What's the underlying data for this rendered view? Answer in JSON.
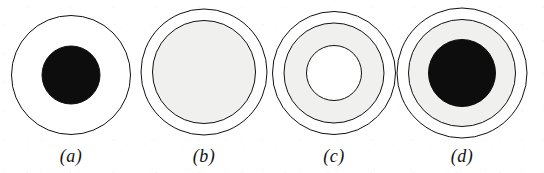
{
  "figure": {
    "kind": "concentric-circle-cross-sections",
    "background_color": "#ffffff",
    "stroke_color": "#111111",
    "fill_white": "#ffffff",
    "fill_gray": "#f0f0ee",
    "fill_black": "#0d0d0d",
    "panel_count": 4,
    "panels": [
      {
        "id": "a",
        "label": "(a)",
        "center_x": 71,
        "center_y": 75,
        "label_x": 71,
        "label_y": 147,
        "layers": [
          {
            "name": "outer-boundary",
            "diameter": 120,
            "fill": "#ffffff",
            "stroke": "#111111",
            "stroke_width": 1.6
          },
          {
            "name": "black-core",
            "diameter": 59,
            "fill": "#0d0d0d",
            "stroke": "#0d0d0d",
            "stroke_width": 1
          }
        ]
      },
      {
        "id": "b",
        "label": "(b)",
        "center_x": 204,
        "center_y": 72,
        "label_x": 204,
        "label_y": 147,
        "layers": [
          {
            "name": "outer-boundary",
            "diameter": 127,
            "fill": "#ffffff",
            "stroke": "#111111",
            "stroke_width": 1.6
          },
          {
            "name": "gray-inner-disc",
            "diameter": 104,
            "fill": "#f0f0ee",
            "stroke": "#111111",
            "stroke_width": 1.6
          }
        ]
      },
      {
        "id": "c",
        "label": "(c)",
        "center_x": 334,
        "center_y": 73,
        "label_x": 334,
        "label_y": 147,
        "layers": [
          {
            "name": "outer-boundary",
            "diameter": 124,
            "fill": "#ffffff",
            "stroke": "#111111",
            "stroke_width": 1.6
          },
          {
            "name": "gray-annulus",
            "diameter": 101,
            "fill": "#f0f0ee",
            "stroke": "#111111",
            "stroke_width": 1.6
          },
          {
            "name": "white-core",
            "diameter": 56,
            "fill": "#ffffff",
            "stroke": "#111111",
            "stroke_width": 1.6
          }
        ]
      },
      {
        "id": "d",
        "label": "(d)",
        "center_x": 462,
        "center_y": 73,
        "label_x": 462,
        "label_y": 147,
        "layers": [
          {
            "name": "outer-boundary",
            "diameter": 131,
            "fill": "#ffffff",
            "stroke": "#111111",
            "stroke_width": 1.6
          },
          {
            "name": "gray-annulus",
            "diameter": 108,
            "fill": "#f0f0ee",
            "stroke": "#111111",
            "stroke_width": 1.6
          },
          {
            "name": "black-core",
            "diameter": 68,
            "fill": "#0d0d0d",
            "stroke": "#0d0d0d",
            "stroke_width": 1
          }
        ]
      }
    ]
  }
}
